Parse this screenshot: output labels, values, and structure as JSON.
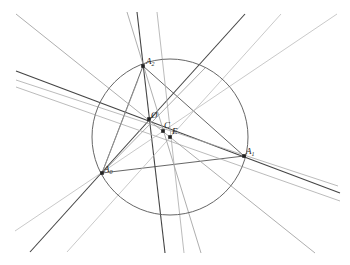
{
  "diagram": {
    "circle": {
      "cx": 170,
      "cy": 137,
      "r": 78,
      "color": "#666666"
    },
    "points": [
      {
        "id": "A2",
        "label": "A",
        "sub": "2",
        "x": 143,
        "y": 66,
        "lx": 146,
        "ly": 64
      },
      {
        "id": "A1",
        "label": "A",
        "sub": "1",
        "x": 244,
        "y": 156,
        "lx": 246,
        "ly": 154
      },
      {
        "id": "A0",
        "label": "A",
        "sub": "0",
        "x": 102,
        "y": 173,
        "lx": 104,
        "ly": 172
      },
      {
        "id": "O",
        "label": "Ø",
        "sub": "",
        "x": 149,
        "y": 119,
        "lx": 151,
        "ly": 118
      },
      {
        "id": "C",
        "label": "C",
        "sub": "",
        "x": 163,
        "y": 131,
        "lx": 164,
        "ly": 128
      },
      {
        "id": "E",
        "label": "E",
        "sub": "",
        "x": 170,
        "y": 137,
        "lx": 172,
        "ly": 134
      }
    ],
    "lines": [
      {
        "x1": 143,
        "y1": 66,
        "x2": 244,
        "y2": 156,
        "color": "#555555",
        "w": 0.9
      },
      {
        "x1": 143,
        "y1": 66,
        "x2": 102,
        "y2": 173,
        "color": "#555555",
        "w": 0.9
      },
      {
        "x1": 102,
        "y1": 173,
        "x2": 244,
        "y2": 156,
        "color": "#555555",
        "w": 0.9
      },
      {
        "x1": 137,
        "y1": 12,
        "x2": 165,
        "y2": 253,
        "color": "#444444",
        "w": 1.1
      },
      {
        "x1": 16,
        "y1": 71,
        "x2": 340,
        "y2": 193,
        "color": "#444444",
        "w": 1.1
      },
      {
        "x1": 30,
        "y1": 252,
        "x2": 245,
        "y2": 14,
        "color": "#444444",
        "w": 1.1
      },
      {
        "x1": 16,
        "y1": 80,
        "x2": 338,
        "y2": 186,
        "color": "#aaaaaa",
        "w": 0.8
      },
      {
        "x1": 16,
        "y1": 87,
        "x2": 340,
        "y2": 201,
        "color": "#aaaaaa",
        "w": 0.8
      },
      {
        "x1": 16,
        "y1": 14,
        "x2": 315,
        "y2": 253,
        "color": "#999999",
        "w": 0.8
      },
      {
        "x1": 15,
        "y1": 231,
        "x2": 337,
        "y2": 14,
        "color": "#bbbbbb",
        "w": 0.8
      },
      {
        "x1": 67,
        "y1": 252,
        "x2": 281,
        "y2": 14,
        "color": "#bbbbbb",
        "w": 0.8
      },
      {
        "x1": 127,
        "y1": 12,
        "x2": 201,
        "y2": 253,
        "color": "#999999",
        "w": 0.8
      },
      {
        "x1": 157,
        "y1": 12,
        "x2": 184,
        "y2": 253,
        "color": "#aaaaaa",
        "w": 0.8
      },
      {
        "x1": 102,
        "y1": 173,
        "x2": 205,
        "y2": 68,
        "color": "#999999",
        "w": 0.8
      },
      {
        "x1": 102,
        "y1": 173,
        "x2": 138,
        "y2": 80,
        "color": "#999999",
        "w": 0.8
      }
    ]
  }
}
